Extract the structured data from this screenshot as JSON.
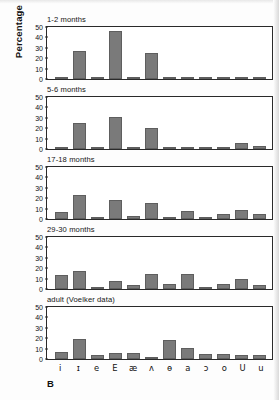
{
  "figure": {
    "panel_letter": "B",
    "ylabel": "Percentage",
    "accent_color": "#7a7a7a",
    "axis_color": "#2a2a2a"
  },
  "chart_data": {
    "type": "bar",
    "xlabel": "",
    "ylabel": "Percentage",
    "ylim": [
      0,
      50
    ],
    "yticks": [
      0,
      10,
      20,
      30,
      40,
      50
    ],
    "grid": false,
    "legend": "none",
    "categories": [
      "i",
      "ɪ",
      "e",
      "E",
      "æ",
      "ʌ",
      "ɵ",
      "a",
      "ɔ",
      "o",
      "U",
      "u"
    ],
    "panels": [
      {
        "label": "1-2 months",
        "values": [
          1,
          27,
          1,
          46,
          1,
          25,
          0,
          0,
          1.5,
          0,
          0,
          1.5
        ]
      },
      {
        "label": "5-6 months",
        "values": [
          1,
          25,
          1.5,
          31,
          2,
          20.5,
          0.5,
          0.8,
          0.5,
          0.8,
          6,
          3
        ]
      },
      {
        "label": "17-18 months",
        "values": [
          6.5,
          23,
          2,
          18,
          2.5,
          15,
          1,
          7.5,
          0,
          4.5,
          8.5,
          4.5
        ]
      },
      {
        "label": "29-30 months",
        "values": [
          13.5,
          17.5,
          2,
          8,
          4,
          14.5,
          4.5,
          14,
          1.5,
          4.5,
          10,
          4
        ]
      },
      {
        "label": "adult (Voelker data)",
        "values": [
          7,
          19,
          4,
          5.5,
          5.5,
          2,
          18,
          11,
          5,
          5,
          4,
          4
        ]
      }
    ]
  }
}
